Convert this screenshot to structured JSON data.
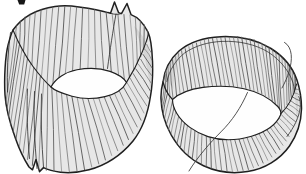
{
  "figure": {
    "label": "Hand-drawn illustration of two vertically ribbed cylindrical bands; the left band is tall with a split seam and forked flaps, the right band is shorter with thin fiber whiskers",
    "background": "#ffffff",
    "palette": {
      "band_fill": "#e7e7e7",
      "band_fill_dark": "#cfcfcf",
      "rib_stroke": "#5c5c5c",
      "outline": "#1f1f1f",
      "hole_fill": "#fefefe",
      "fiber_stroke": "#3d3d3d",
      "fragment_ink": "#161616"
    },
    "objects": [
      {
        "id": "left-band",
        "label": "tall split ribbed band"
      },
      {
        "id": "right-band",
        "label": "short ribbed band with fibers"
      },
      {
        "id": "cropped-text-fragment",
        "label": "cut-off letter fragment at top edge"
      }
    ],
    "drawing": {
      "left": {
        "silhouette": "M 13,30 C 22,17.5 37,9 55,6.5 C 63,5.4 71,5.8 79,7 C 89,8.4 100,10.2 108,12.6 L 110.5,13.2 L 114.5,2 L 118.5,12.6 L 121.5,13.6 L 127,3.5 L 131,14.6 C 137.5,17 144,24 148,32 C 150.5,37.5 152,48 152.5,61 C 153,74 152.3,86 150.5,96 C 148,113 142.5,129 133,141 C 121,155.5 105,165.5 89,169.8 C 79,172.4 68.5,173.2 60.5,172.2 C 53.5,171.3 47.5,169.6 43.5,167.6 L 39.5,171.6 L 36,159.5 L 32.5,169.8 L 29,167 C 24.5,160 19.5,150 15.5,138.5 C 9.5,122 5.8,108 5,95 C 4,78 5.2,56 8.2,44.5 C 9.8,38.5 11.2,33.5 13,30 Z",
        "shade": [
          "M 134,26 C 142,33 148.5,45 151,59 C 152,70 151.8,81 150.5,90 C 148.5,76 146,60 142,48.5 C 139,40 136.5,32.5 134,26 Z",
          "M 9,42 C 6,62 5.6,82 7,98 L 11,116 C 8.5,98 8.5,70 11,48 Z"
        ],
        "ribs": [
          {
            "count": 26,
            "top": [
              [
                13,
                30
              ],
              [
                22,
                18.5
              ],
              [
                33,
                12
              ],
              [
                45,
                8
              ],
              [
                57,
                6.3
              ],
              [
                70,
                5.9
              ],
              [
                83,
                7.3
              ],
              [
                96,
                9.5
              ],
              [
                108,
                12.6
              ],
              [
                119,
                14
              ],
              [
                131,
                14.6
              ],
              [
                140,
                19.5
              ],
              [
                146,
                26.5
              ],
              [
                150,
                35
              ]
            ],
            "bottom": [
              [
                13,
                30
              ],
              [
                19,
                43.5
              ],
              [
                26,
                55.8
              ],
              [
                33,
                66.5
              ],
              [
                42,
                78.5
              ],
              [
                51,
                87
              ],
              [
                58,
                80.5
              ],
              [
                66,
                74.8
              ],
              [
                76,
                70.6
              ],
              [
                87,
                68.6
              ],
              [
                98,
                68.9
              ],
              [
                109,
                71.2
              ],
              [
                118,
                74.9
              ],
              [
                126.5,
                82.4
              ],
              [
                132.5,
                73.5
              ],
              [
                138,
                63
              ],
              [
                143,
                52
              ],
              [
                146.5,
                42.5
              ],
              [
                150,
                35
              ]
            ]
          },
          {
            "count": 37,
            "top": [
              [
                13,
                30
              ],
              [
                18.5,
                43
              ],
              [
                25,
                55.5
              ],
              [
                33,
                66.5
              ],
              [
                42,
                78.5
              ],
              [
                51,
                87
              ],
              [
                60,
                91.8
              ],
              [
                70,
                95
              ],
              [
                80,
                97.2
              ],
              [
                90,
                97.9
              ],
              [
                100,
                96.4
              ],
              [
                110,
                93
              ],
              [
                118.5,
                88.5
              ],
              [
                126.5,
                82.4
              ],
              [
                133,
                73.3
              ],
              [
                139,
                62.5
              ],
              [
                144,
                51.5
              ],
              [
                148.5,
                39
              ]
            ],
            "bottom": [
              [
                5,
                95
              ],
              [
                6.6,
                110
              ],
              [
                10.5,
                126
              ],
              [
                15.5,
                139
              ],
              [
                21.5,
                151
              ],
              [
                28,
                160.5
              ],
              [
                34.5,
                168.5
              ],
              [
                42,
                170.3
              ],
              [
                50,
                171.3
              ],
              [
                59,
                172.3
              ],
              [
                68,
                172.6
              ],
              [
                78,
                171.6
              ],
              [
                88,
                169.2
              ],
              [
                98,
                164.8
              ],
              [
                108,
                158.8
              ],
              [
                118,
                151
              ],
              [
                127,
                142
              ],
              [
                135,
                131.5
              ],
              [
                141.5,
                120
              ],
              [
                146.5,
                108
              ],
              [
                150,
                95
              ],
              [
                151.8,
                80
              ],
              [
                152.3,
                64
              ],
              [
                150.5,
                45
              ]
            ]
          }
        ],
        "hole": "M 51,87 C 55.5,78.5 65.5,72 77,69.8 C 88,67.8 100,68 110,71.4 C 118,74.2 124,78.3 126.5,82.4 C 123,89 115.5,94 105,96.6 C 94,99.2 82,99 72,96.2 C 62.5,93.5 54.5,90.6 51,87 Z",
        "rim_front": [
          "M 13,30 C 18,42 25,55.5 33,66.5 C 39,74.5 45,81.5 51,87",
          "M 126.5,82.4 C 131.5,74.5 137.5,63.5 141.8,53 C 144.8,45.8 147,40.5 148.5,34"
        ],
        "extra": [
          "M 27.5,89 C 26.5,110 27.5,135 29.5,158.5",
          "M 34.5,91.5 C 33.5,115 34.5,142 37,168.5",
          "M 41.5,94 C 40.5,118 41.8,144 43.5,167",
          "M 116,14 C 113,30 110,50 107.5,68.5",
          "M 10.5,32.5 C 7.8,52 6.8,73 7.5,92",
          "M 110.5,13.2 C 114,14.6 118,14.8 121.5,13.6"
        ]
      },
      "right": {
        "silhouette": "M 163,82 C 164.5,70 170,59 179,51 C 189,42.5 204,37.4 221,36.7 C 239,36 257,40 271,48.5 C 283,56 292.5,67.5 296.8,79.5 C 299.8,88.5 301.6,99 301.5,109 C 301.2,122 297,135 289.5,146 C 280,159.5 264.5,168.8 247.5,171.6 C 232.5,174 216.5,171.8 203.5,165.8 C 189.5,159.2 178.5,148 171.2,135 C 164.8,123.5 161.3,110 161,99 C 160.8,93 161.6,87 163,82 Z",
        "shade": [
          "M 165,74 C 168,65.5 173,58 180,52.5 C 176.5,63 174,76 173.3,89 C 169.8,84.5 166.8,79.5 165,74 Z",
          "M 290.5,70 C 294.5,78.5 297.5,88.5 298.3,98 C 298.8,107 298,116 296,124.5 C 297,107 295,88 289,73.5 Z"
        ],
        "ribs": [
          {
            "count": 42,
            "top": [
              [
                163,
                82
              ],
              [
                166,
                69.5
              ],
              [
                172.5,
                58.5
              ],
              [
                182,
                50
              ],
              [
                194,
                43.4
              ],
              [
                208,
                38.8
              ],
              [
                223,
                36.8
              ],
              [
                239,
                36.3
              ],
              [
                254,
                39.2
              ],
              [
                267,
                45.4
              ],
              [
                278.5,
                53.5
              ],
              [
                288,
                63.5
              ],
              [
                294.5,
                74.5
              ],
              [
                296.8,
                82
              ]
            ],
            "bottom": [
              [
                163,
                82
              ],
              [
                165.5,
                90
              ],
              [
                168.5,
                95.5
              ],
              [
                172.5,
                99.5
              ],
              [
                181,
                94.2
              ],
              [
                191,
                90.3
              ],
              [
                203,
                87.7
              ],
              [
                215,
                86.2
              ],
              [
                227,
                86
              ],
              [
                239,
                87.2
              ],
              [
                251,
                89.9
              ],
              [
                262,
                94
              ],
              [
                271,
                99.5
              ],
              [
                278,
                106.6
              ],
              [
                280.5,
                113
              ],
              [
                285.5,
                107.5
              ],
              [
                291,
                98.5
              ],
              [
                294.8,
                90
              ],
              [
                296.8,
                82
              ]
            ]
          },
          {
            "count": 44,
            "top": [
              [
                163,
                82
              ],
              [
                165.5,
                90
              ],
              [
                168.5,
                95.5
              ],
              [
                172.5,
                99.5
              ],
              [
                177.5,
                107
              ],
              [
                184,
                114.5
              ],
              [
                192,
                121.6
              ],
              [
                201.5,
                127.8
              ],
              [
                212,
                132.8
              ],
              [
                223,
                136
              ],
              [
                234,
                137.2
              ],
              [
                245,
                136
              ],
              [
                255,
                133
              ],
              [
                264,
                128.8
              ],
              [
                272,
                123
              ],
              [
                278,
                117
              ],
              [
                280.5,
                113.5
              ],
              [
                286.5,
                106.5
              ],
              [
                292,
                96.5
              ],
              [
                296.5,
                85
              ]
            ],
            "bottom": [
              [
                161.2,
                99
              ],
              [
                162,
                111
              ],
              [
                165,
                123
              ],
              [
                170.5,
                134.5
              ],
              [
                177.8,
                145.5
              ],
              [
                186.8,
                155
              ],
              [
                197,
                162.4
              ],
              [
                208.5,
                168
              ],
              [
                221,
                171.3
              ],
              [
                234,
                172
              ],
              [
                247,
                170.3
              ],
              [
                259,
                166
              ],
              [
                270,
                159.3
              ],
              [
                279.5,
                150.5
              ],
              [
                287.5,
                140
              ],
              [
                293.5,
                128.5
              ],
              [
                297.8,
                117
              ],
              [
                300.3,
                106
              ],
              [
                300.8,
                96
              ],
              [
                299,
                85
              ]
            ]
          }
        ],
        "inner_rim": "M 166.8,82 C 169.2,70.5 175.6,60 184.6,53 C 195,45.8 208,42 222,41.4 C 239,40.7 255.8,44.4 268.3,52.2 C 279.8,59.6 288.3,70 292.4,81 C 293.6,84.4 294.2,88.2 294.2,92",
        "hole": "M 172.5,99.5 C 178.5,93.8 190,89.2 203,87.4 C 216,85.7 231,85.9 244,88.7 C 257,91.5 269.5,97.8 277.8,106.5 C 280.6,109.6 281.5,112.3 280.5,115 C 276.5,124.5 265.5,132 251.5,136.2 C 237,140.5 221,140.8 208,136.6 C 195,132.4 183,123.8 177,113.8 C 174,108.8 172.5,104 172.5,99.5 Z",
        "rim_front": [
          "M 163,82 C 165,89.5 168.3,95.3 172.5,99.5",
          "M 280.5,114 C 288.5,106.5 293.8,96.5 296.5,84"
        ],
        "extra": [],
        "fibers": [
          "M 282,88 C 288,77 292.2,65 291.2,54.5 C 290.6,48.8 288.2,44.6 284.5,42.4",
          "M 247.5,92.5 C 241,107.5 232,121 221,131.8 C 210.5,142.3 197.5,157 189,171",
          "M 287,136.5 C 294,127.5 299,117.5 300.2,107.5 C 300.6,103.5 300.2,99.8 298.8,96.5"
        ]
      },
      "fragment": "M 17.5,0 L 25.5,0 L 24.2,4.6 L 19.2,4.6 Z"
    }
  }
}
